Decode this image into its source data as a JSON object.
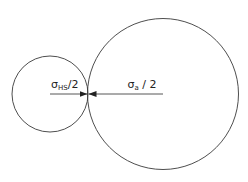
{
  "diagram": {
    "type": "tangent-circles",
    "stroke_color": "#3a3a3a",
    "background": "#ffffff",
    "small_circle": {
      "cx": 50,
      "cy": 94,
      "r": 38,
      "label_symbol": "σ",
      "label_subscript": "HS",
      "label_suffix": "/2"
    },
    "large_circle": {
      "cx": 163,
      "cy": 94,
      "r": 75,
      "label_symbol": "σ",
      "label_subscript": "a",
      "label_suffix": " / 2"
    },
    "contact_point": {
      "x": 88,
      "y": 94
    }
  }
}
